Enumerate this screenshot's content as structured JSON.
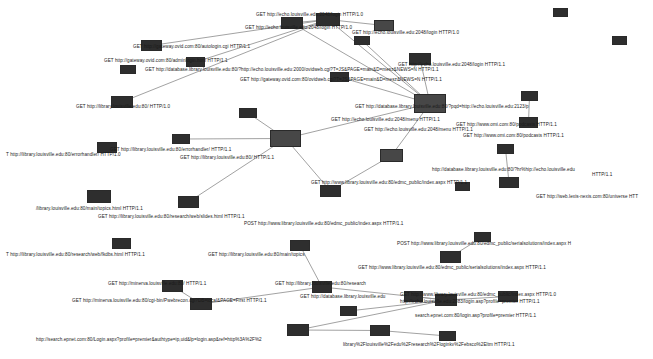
{
  "graph": {
    "type": "network-graph",
    "title": "",
    "background_color": "#ffffff",
    "node_color": "#3a3a3a",
    "edge_color": "#8a8a8a",
    "label_color": "#1a1a1a",
    "node_count": 40,
    "edge_count": 30,
    "nodes": [
      {
        "id": "n1",
        "x": 141,
        "y": 40,
        "w": 21,
        "h": 11,
        "shade": "dark"
      },
      {
        "id": "n2",
        "x": 186,
        "y": 57,
        "w": 19,
        "h": 10,
        "shade": "dark"
      },
      {
        "id": "n3",
        "x": 111,
        "y": 96,
        "w": 22,
        "h": 12,
        "shade": "dark"
      },
      {
        "id": "n4",
        "x": 316,
        "y": 13,
        "w": 24,
        "h": 13,
        "shade": "dark"
      },
      {
        "id": "n5",
        "x": 374,
        "y": 20,
        "w": 20,
        "h": 11,
        "shade": "mid"
      },
      {
        "id": "n6",
        "x": 330,
        "y": 72,
        "w": 19,
        "h": 10,
        "shade": "dark"
      },
      {
        "id": "n7",
        "x": 409,
        "y": 53,
        "w": 22,
        "h": 12,
        "shade": "dark"
      },
      {
        "id": "n8",
        "x": 414,
        "y": 94,
        "w": 32,
        "h": 19,
        "shade": "mid"
      },
      {
        "id": "n9",
        "x": 521,
        "y": 91,
        "w": 17,
        "h": 10,
        "shade": "dark"
      },
      {
        "id": "n10",
        "x": 519,
        "y": 117,
        "w": 19,
        "h": 11,
        "shade": "dark"
      },
      {
        "id": "n11",
        "x": 281,
        "y": 17,
        "w": 22,
        "h": 12,
        "shade": "dark"
      },
      {
        "id": "n12",
        "x": 270,
        "y": 130,
        "w": 31,
        "h": 17,
        "shade": "mid"
      },
      {
        "id": "n13",
        "x": 172,
        "y": 134,
        "w": 18,
        "h": 10,
        "shade": "dark"
      },
      {
        "id": "n14",
        "x": 97,
        "y": 142,
        "w": 20,
        "h": 11,
        "shade": "dark"
      },
      {
        "id": "n15",
        "x": 87,
        "y": 190,
        "w": 24,
        "h": 13,
        "shade": "dark"
      },
      {
        "id": "n16",
        "x": 178,
        "y": 196,
        "w": 21,
        "h": 12,
        "shade": "dark"
      },
      {
        "id": "n17",
        "x": 380,
        "y": 149,
        "w": 23,
        "h": 13,
        "shade": "mid"
      },
      {
        "id": "n18",
        "x": 320,
        "y": 185,
        "w": 21,
        "h": 12,
        "shade": "dark"
      },
      {
        "id": "n19",
        "x": 497,
        "y": 144,
        "w": 17,
        "h": 10,
        "shade": "dark"
      },
      {
        "id": "n20",
        "x": 499,
        "y": 177,
        "w": 20,
        "h": 11,
        "shade": "dark"
      },
      {
        "id": "n21",
        "x": 112,
        "y": 238,
        "w": 19,
        "h": 11,
        "shade": "dark"
      },
      {
        "id": "n22",
        "x": 290,
        "y": 240,
        "w": 20,
        "h": 11,
        "shade": "dark"
      },
      {
        "id": "n23",
        "x": 474,
        "y": 232,
        "w": 17,
        "h": 10,
        "shade": "dark"
      },
      {
        "id": "n24",
        "x": 440,
        "y": 251,
        "w": 21,
        "h": 12,
        "shade": "dark"
      },
      {
        "id": "n25",
        "x": 162,
        "y": 280,
        "w": 21,
        "h": 12,
        "shade": "dark"
      },
      {
        "id": "n26",
        "x": 190,
        "y": 298,
        "w": 22,
        "h": 12,
        "shade": "dark"
      },
      {
        "id": "n27",
        "x": 312,
        "y": 281,
        "w": 20,
        "h": 12,
        "shade": "dark"
      },
      {
        "id": "n28",
        "x": 404,
        "y": 291,
        "w": 19,
        "h": 11,
        "shade": "dark"
      },
      {
        "id": "n29",
        "x": 435,
        "y": 294,
        "w": 22,
        "h": 12,
        "shade": "dark"
      },
      {
        "id": "n30",
        "x": 498,
        "y": 291,
        "w": 20,
        "h": 11,
        "shade": "dark"
      },
      {
        "id": "n31",
        "x": 287,
        "y": 324,
        "w": 22,
        "h": 12,
        "shade": "dark"
      },
      {
        "id": "n32",
        "x": 370,
        "y": 325,
        "w": 20,
        "h": 11,
        "shade": "dark"
      },
      {
        "id": "n33",
        "x": 439,
        "y": 331,
        "w": 17,
        "h": 10,
        "shade": "dark"
      },
      {
        "id": "n34",
        "x": 340,
        "y": 306,
        "w": 17,
        "h": 10,
        "shade": "dark"
      },
      {
        "id": "n35",
        "x": 239,
        "y": 108,
        "w": 18,
        "h": 10,
        "shade": "dark"
      },
      {
        "id": "n36",
        "x": 354,
        "y": 36,
        "w": 16,
        "h": 9,
        "shade": "dark"
      },
      {
        "id": "n37",
        "x": 120,
        "y": 65,
        "w": 16,
        "h": 9,
        "shade": "dark"
      },
      {
        "id": "n38",
        "x": 553,
        "y": 8,
        "w": 15,
        "h": 9,
        "shade": "dark"
      },
      {
        "id": "n39",
        "x": 612,
        "y": 36,
        "w": 15,
        "h": 9,
        "shade": "dark"
      },
      {
        "id": "n40",
        "x": 455,
        "y": 182,
        "w": 15,
        "h": 9,
        "shade": "dark"
      }
    ],
    "edges": [
      {
        "from": "n1",
        "to": "n4"
      },
      {
        "from": "n2",
        "to": "n4"
      },
      {
        "from": "n3",
        "to": "n4"
      },
      {
        "from": "n11",
        "to": "n4"
      },
      {
        "from": "n4",
        "to": "n5"
      },
      {
        "from": "n4",
        "to": "n8"
      },
      {
        "from": "n11",
        "to": "n8"
      },
      {
        "from": "n6",
        "to": "n8"
      },
      {
        "from": "n7",
        "to": "n8"
      },
      {
        "from": "n36",
        "to": "n8"
      },
      {
        "from": "n8",
        "to": "n12"
      },
      {
        "from": "n8",
        "to": "n17"
      },
      {
        "from": "n9",
        "to": "n10"
      },
      {
        "from": "n12",
        "to": "n13"
      },
      {
        "from": "n12",
        "to": "n16"
      },
      {
        "from": "n12",
        "to": "n18"
      },
      {
        "from": "n17",
        "to": "n18"
      },
      {
        "from": "n19",
        "to": "n20"
      },
      {
        "from": "n23",
        "to": "n24"
      },
      {
        "from": "n25",
        "to": "n26"
      },
      {
        "from": "n26",
        "to": "n27"
      },
      {
        "from": "n27",
        "to": "n22"
      },
      {
        "from": "n27",
        "to": "n29"
      },
      {
        "from": "n28",
        "to": "n29"
      },
      {
        "from": "n29",
        "to": "n30"
      },
      {
        "from": "n29",
        "to": "n34"
      },
      {
        "from": "n31",
        "to": "n32"
      },
      {
        "from": "n32",
        "to": "n33"
      },
      {
        "from": "n31",
        "to": "n29"
      },
      {
        "from": "n35",
        "to": "n12"
      }
    ],
    "labels": [
      {
        "id": "l1",
        "x": 245,
        "y": 25,
        "text": "GET http://echo.louisville.edu:2048/login HTTP/1.0"
      },
      {
        "id": "l2",
        "x": 352,
        "y": 30,
        "text": "GET http://echo.louisville.edu:2048/login HTTP/1.0"
      },
      {
        "id": "l3",
        "x": 133,
        "y": 44,
        "text": "GET http://gateway.ovid.com:80/autologin.cgi HTTP/1.1"
      },
      {
        "id": "l4",
        "x": 104,
        "y": 58,
        "text": "GET http://gateway.ovid.com:80/adminlogin.html HTTP/1.1"
      },
      {
        "id": "l5",
        "x": 145,
        "y": 67,
        "text": "GET http://database.library.louisville.edu:80/?http://echo.louisville.edu:2000/ovidweb.cgi?T=JS&PAGE=main&D=mesz&NEWS=N HTTP/1.1"
      },
      {
        "id": "l6",
        "x": 398,
        "y": 62,
        "text": "GET http://echo.louisville.edu:2048/login HTTP/1.1"
      },
      {
        "id": "l7",
        "x": 240,
        "y": 77,
        "text": "GET http://gateway.ovid.com:80/ovidweb.cgi?T=JS&PAGE=main&D=mesz&NEWS=N HTTP/1.1"
      },
      {
        "id": "l8",
        "x": 355,
        "y": 104,
        "text": "GET http://database.library.louisville.edu:80/?pqd=http://echo.louisville.edu:2123/p"
      },
      {
        "id": "l9",
        "x": 76,
        "y": 104,
        "text": "GET http://library.louisville.edu:80/ HTTP/1.0"
      },
      {
        "id": "l10",
        "x": 331,
        "y": 117,
        "text": "GET http://echo.louisville.edu:2048/menu HTTP/1.1"
      },
      {
        "id": "l11",
        "x": 463,
        "y": 133,
        "text": "GET http://www.omi.com:80/podcasts HTTP/1.1"
      },
      {
        "id": "l12",
        "x": 6,
        "y": 152,
        "text": "T http://library.louisville.edu:80/errorhandler/ HTTP/1.0"
      },
      {
        "id": "l13",
        "x": 110,
        "y": 147,
        "text": "GET http://library.louisville.edu:80/errorhandler/ HTTP/1.1"
      },
      {
        "id": "l14",
        "x": 180,
        "y": 155,
        "text": "GET http://library.louisville.edu:80/ HTTP/1.1"
      },
      {
        "id": "l15",
        "x": 432,
        "y": 167,
        "text": "http://database.library.louisville.edu:80/?hr%hip://echo.louisville.edu"
      },
      {
        "id": "l16",
        "x": 311,
        "y": 180,
        "text": "GET http://www.library.louisville.edu:80/edmc_public/index.aspx HTTP/1.1"
      },
      {
        "id": "l17",
        "x": 536,
        "y": 194,
        "text": "GET http://web.lexis-nexis.com:80/universe HTT"
      },
      {
        "id": "l18",
        "x": 36,
        "y": 206,
        "text": "/library.louisville.edu:80/main/topics.html HTTP/1.1"
      },
      {
        "id": "l19",
        "x": 98,
        "y": 214,
        "text": "GET http://library.louisville.edu:80/research/web/slides.html HTTP/1.1"
      },
      {
        "id": "l20",
        "x": 244,
        "y": 221,
        "text": "POST http://www.library.louisville.edu:80/edmc_public/index.aspx HTTP/1.1"
      },
      {
        "id": "l21",
        "x": 6,
        "y": 252,
        "text": "T http://library.louisville.edu:80/research/web/fkdbs.html HTTP/1.1"
      },
      {
        "id": "l22",
        "x": 208,
        "y": 252,
        "text": "GET http://library.louisville.edu:80/main/topics"
      },
      {
        "id": "l23",
        "x": 397,
        "y": 241,
        "text": "POST http://www.library.louisville.edu:80/edmc_public/serialsolutions/index.aspx H"
      },
      {
        "id": "l24",
        "x": 358,
        "y": 265,
        "text": "GET http://www.library.louisville.edu:80/edmc_public/serialsolutions/index.aspx HTTP/1.1"
      },
      {
        "id": "l25",
        "x": 108,
        "y": 281,
        "text": "GET http://minerva.louisville.edu:80/ HTTP/1.1"
      },
      {
        "id": "l26",
        "x": 275,
        "y": 281,
        "text": "GET http://library.louisville.edu:80/research"
      },
      {
        "id": "l27",
        "x": 72,
        "y": 298,
        "text": "GET http://minerva.louisville.edu:80/cgi-bin/Pwebrecon.cgi?DB=local&PAGE=First HTTP/1.1"
      },
      {
        "id": "l28",
        "x": 300,
        "y": 294,
        "text": "GET http://database.library.louisville.edu"
      },
      {
        "id": "l29",
        "x": 400,
        "y": 292,
        "text": "GET http://www.library.louisville.edu:80/edmc_public/index.aspx HTTP/1.0"
      },
      {
        "id": "l30",
        "x": 400,
        "y": 299,
        "text": "http://echo.louisville.edu:2083/login.asp?profile=premier HTTP/1.1"
      },
      {
        "id": "l31",
        "x": 415,
        "y": 313,
        "text": "search.epnet.com:80/login.asp?profile=premier HTTP/1.1"
      },
      {
        "id": "l32",
        "x": 36,
        "y": 337,
        "text": "http://search.epnet.com:80/Login.aspx?profile=premier&authtype=ip,uid&lp=login.asp&ref=http%3A%2F%2"
      },
      {
        "id": "l33",
        "x": 343,
        "y": 342,
        "text": "library%2Flouisville%2Fedu%2Fresearch%2Floginkv%2Febsco%2Eltm HTTP/1.1"
      },
      {
        "id": "l34",
        "x": 256,
        "y": 12,
        "text": "GET http://echo.louisville.edu:2048/login HTTP/1.0"
      },
      {
        "id": "l35",
        "x": 456,
        "y": 122,
        "text": "GET http://www.omi.com:80/podcasts HTTP/1.1"
      },
      {
        "id": "l36",
        "x": 364,
        "y": 127,
        "text": "GET http://echo.louisville.edu:2048/menu HTTP/1.1"
      },
      {
        "id": "l37",
        "x": 592,
        "y": 172,
        "text": "HTTP/1.1"
      }
    ]
  }
}
